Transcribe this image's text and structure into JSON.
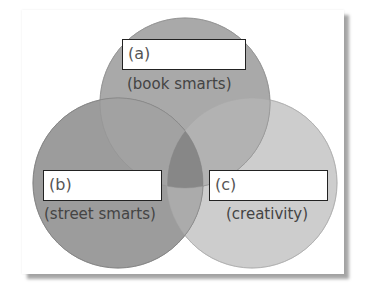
{
  "diagram": {
    "type": "venn",
    "sets": [
      {
        "id": "a",
        "box_label": "(a)",
        "caption": "(book smarts)",
        "color": "#a6a6a6"
      },
      {
        "id": "b",
        "box_label": "(b)",
        "caption": "(street smarts)",
        "color": "#999999"
      },
      {
        "id": "c",
        "box_label": "(c)",
        "caption": "(creativity)",
        "color": "#cbcbcb"
      }
    ],
    "overlap_color_ab": "#8a8a8a",
    "center_color": "#7f7f7f"
  }
}
